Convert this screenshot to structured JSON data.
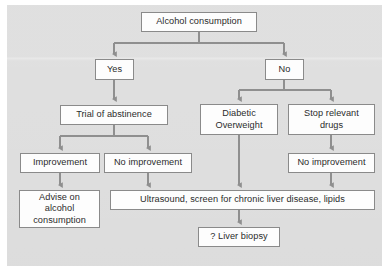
{
  "figure": {
    "kind": "clinical-decision-flowchart",
    "panel_background": "#dcdcdc",
    "node_fill": "#fdfdfd",
    "node_border": "#8a8a8a",
    "connector_color": "#8f8f8f",
    "text_color": "#2b2b2b"
  },
  "nodes": {
    "alcohol_consumption": "Alcohol consumption",
    "yes": "Yes",
    "no": "No",
    "trial_of_abstinence": "Trial of abstinence",
    "diabetic_overweight": "Diabetic\nOverweight",
    "stop_relevant_drugs": "Stop relevant\ndrugs",
    "improvement": "Improvement",
    "no_improvement_left": "No improvement",
    "no_improvement_right": "No improvement",
    "advise_on_alcohol": "Advise on\nalcohol\nconsumption",
    "ultrasound": "Ultrasound, screen for chronic liver disease, lipids",
    "liver_biopsy": "? Liver biopsy"
  },
  "flow": {
    "edges": [
      {
        "from": "alcohol_consumption",
        "to": "yes"
      },
      {
        "from": "alcohol_consumption",
        "to": "no"
      },
      {
        "from": "yes",
        "to": "trial_of_abstinence"
      },
      {
        "from": "no",
        "to": "diabetic_overweight"
      },
      {
        "from": "no",
        "to": "stop_relevant_drugs"
      },
      {
        "from": "trial_of_abstinence",
        "to": "improvement"
      },
      {
        "from": "trial_of_abstinence",
        "to": "no_improvement_left"
      },
      {
        "from": "stop_relevant_drugs",
        "to": "no_improvement_right"
      },
      {
        "from": "improvement",
        "to": "advise_on_alcohol"
      },
      {
        "from": "no_improvement_left",
        "to": "ultrasound"
      },
      {
        "from": "diabetic_overweight",
        "to": "ultrasound"
      },
      {
        "from": "no_improvement_right",
        "to": "ultrasound"
      },
      {
        "from": "ultrasound",
        "to": "liver_biopsy"
      }
    ]
  }
}
